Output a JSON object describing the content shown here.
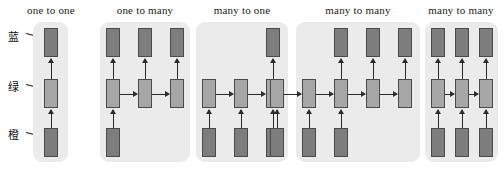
{
  "figure": {
    "colors": {
      "panel_background": "#ebebeb",
      "io_cell": "#7d7d7d",
      "hidden_cell": "#a6a6a6",
      "cell_border": "#4a4a4a",
      "arrow": "#2b2b2b",
      "page_background": "#ffffff"
    }
  },
  "annotations": [
    {
      "text": "蓝",
      "meaning": "blue",
      "target": "output-layer"
    },
    {
      "text": "绿",
      "meaning": "green",
      "target": "hidden-layer"
    },
    {
      "text": "橙",
      "meaning": "orange",
      "target": "input-layer"
    }
  ],
  "panels": [
    {
      "id": "one-to-one",
      "title": "one to one",
      "inputs": 1,
      "hidden": 1,
      "outputs": 1
    },
    {
      "id": "one-to-many",
      "title": "one to many",
      "inputs": 1,
      "hidden": 3,
      "outputs": 3
    },
    {
      "id": "many-to-one",
      "title": "many to one",
      "inputs": 3,
      "hidden": 3,
      "outputs": 1
    },
    {
      "id": "many-to-many-seq2seq",
      "title": "many to many",
      "inputs": 3,
      "hidden": 5,
      "outputs": 3
    },
    {
      "id": "many-to-many-synced",
      "title": "many to many",
      "inputs": 3,
      "hidden": 3,
      "outputs": 3
    }
  ]
}
